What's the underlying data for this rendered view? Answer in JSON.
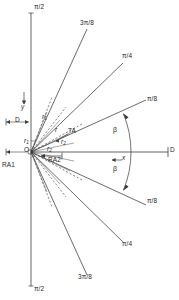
{
  "diagram": {
    "type": "technical-line-drawing",
    "background_color": "#ffffff",
    "line_color": "#3a3a3a",
    "text_color": "#262626",
    "axes": {
      "vertical_axis_top_label": "π/2",
      "vertical_axis_bottom_label": "π/2",
      "y_axis_label": "y",
      "x_axis_label": "x",
      "origin_label": "O"
    },
    "angle_labels": {
      "upper_3pi8": "3π/8",
      "upper_pi4": "π/4",
      "upper_pi8": "π/8",
      "lower_pi8": "π/8",
      "lower_pi4": "π/4",
      "lower_3pi8": "3π/8"
    },
    "annotations": {
      "ra1": "RA1",
      "ra2": "RA2",
      "ta": "TA",
      "beta_upper": "β",
      "beta_lower": "β",
      "dim_d": "D",
      "radius_r": "r",
      "radius_r1_upper": "r",
      "radius_r1_upper_sub": "1",
      "radius_r1_origin": "r",
      "radius_r1_origin_sub": "1",
      "radius_r2_mid": "r",
      "radius_r2_mid_sub": "2",
      "radius_r2_lower": "r",
      "radius_r2_lower_sub": "2",
      "right_marker_top": "D",
      "right_marker_bottom": "D"
    },
    "rays": {
      "solid_upper_deg": [
        67.5,
        45.0,
        22.5
      ],
      "solid_lower_deg": [
        -22.5,
        -45.0,
        -67.5
      ],
      "dashed_upper_deg": [
        78.0,
        57.0,
        34.0
      ],
      "dashed_lower_deg": [
        -34.0,
        -57.0,
        -78.0
      ],
      "beta_arc_upper_deg": [
        0,
        22.5
      ],
      "beta_arc_lower_deg": [
        -22.5,
        0
      ]
    }
  }
}
